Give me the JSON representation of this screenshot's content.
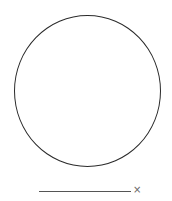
{
  "canvas": {
    "shape": "circle",
    "stroke_color": "#2a2a2a"
  },
  "input": {
    "value": "",
    "clear_icon": "×"
  }
}
